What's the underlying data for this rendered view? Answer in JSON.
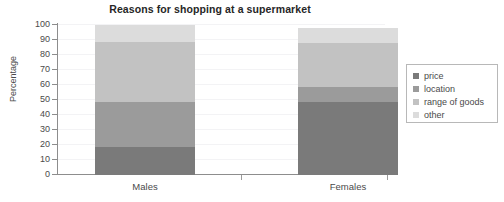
{
  "chart_data": {
    "type": "bar",
    "subtype": "stacked-bar",
    "title": "Reasons for shopping at a supermarket",
    "xlabel": "",
    "ylabel": "Percentage",
    "categories": [
      "Males",
      "Females"
    ],
    "ylim": [
      0,
      100
    ],
    "yticks": [
      0,
      10,
      20,
      30,
      40,
      50,
      60,
      70,
      80,
      90,
      100
    ],
    "ytick_labels": [
      "0",
      "10",
      "20",
      "30",
      "40",
      "50",
      "60",
      "70",
      "80",
      "90",
      "100"
    ],
    "grid": true,
    "legend_position": "right",
    "series": [
      {
        "name": "price",
        "values": [
          19,
          49
        ],
        "color": "#7a7a7a"
      },
      {
        "name": "location",
        "values": [
          30,
          10
        ],
        "color": "#9b9b9b"
      },
      {
        "name": "range of goods",
        "values": [
          40,
          29
        ],
        "color": "#c2c2c2"
      },
      {
        "name": "other",
        "values": [
          11,
          10
        ],
        "color": "#dcdcdc"
      }
    ],
    "cumulative_tops": {
      "Males": {
        "price": 19,
        "location": 49,
        "range of goods": 89,
        "other": 100
      },
      "Females": {
        "price": 49,
        "location": 59,
        "range of goods": 88,
        "other": 98
      }
    }
  },
  "legend": {
    "items": [
      {
        "label": "price",
        "color": "#7a7a7a"
      },
      {
        "label": "location",
        "color": "#9b9b9b"
      },
      {
        "label": "range of goods",
        "color": "#c2c2c2"
      },
      {
        "label": "other",
        "color": "#dcdcdc"
      }
    ]
  }
}
